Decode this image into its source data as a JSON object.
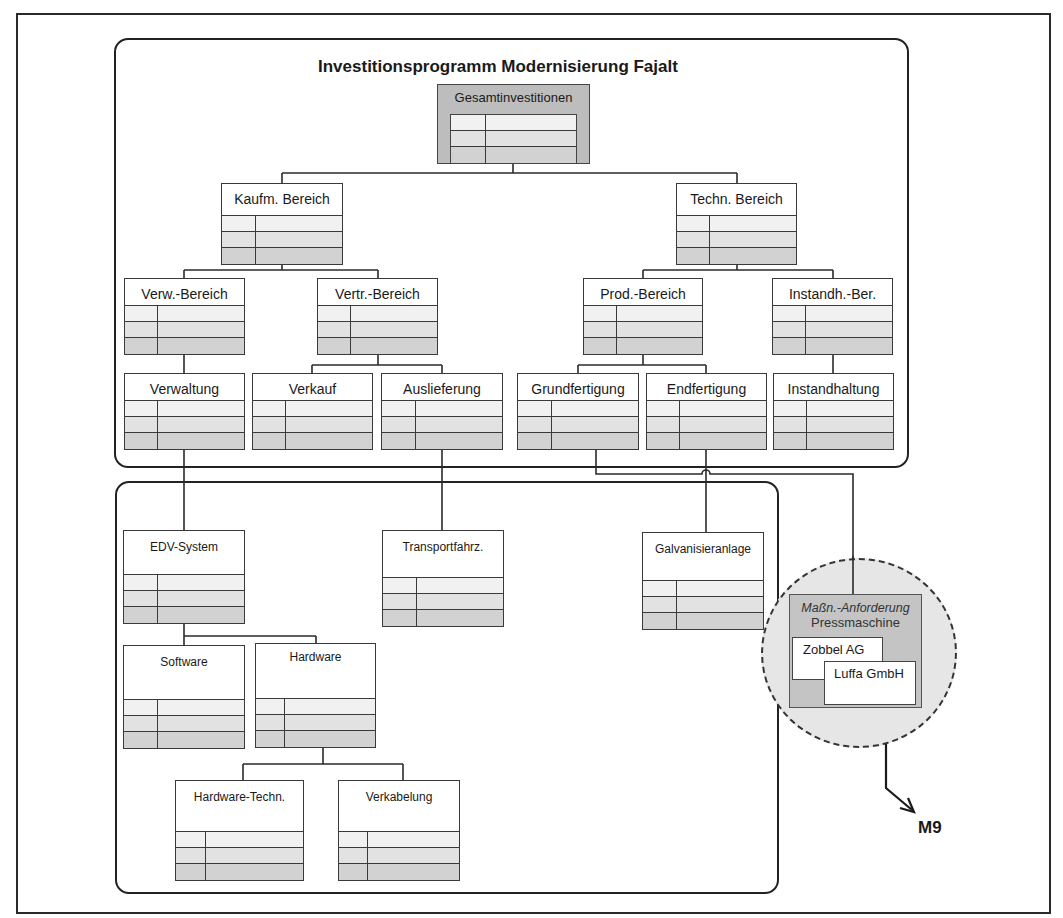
{
  "diagram": {
    "title": "Investitionsprogramm Modernisierung Fajalt",
    "root": {
      "label": "Gesamtinvestitionen"
    },
    "upper_nodes": {
      "kaufm": "Kaufm. Bereich",
      "techn": "Techn. Bereich",
      "verw_bereich": "Verw.-Bereich",
      "vertr_bereich": "Vertr.-Bereich",
      "prod_bereich": "Prod.-Bereich",
      "instandh_ber": "Instandh.-Ber.",
      "verwaltung": "Verwaltung",
      "verkauf": "Verkauf",
      "auslieferung": "Auslieferung",
      "grundfertigung": "Grundfertigung",
      "endfertigung": "Endfertigung",
      "instandhaltung": "Instandhaltung"
    },
    "lower_nodes": {
      "edv_system": "EDV-System",
      "transportfahrz": "Transportfahrz.",
      "galvanisieranlage": "Galvanisieranlage",
      "software": "Software",
      "hardware": "Hardware",
      "hardware_techn": "Hardware-Techn.",
      "verkabelung": "Verkabelung"
    },
    "measure_request": {
      "heading": "Maßn.-Anforderung",
      "subject": "Pressmaschine",
      "suppliers": [
        "Zobbel AG",
        "Luffa GmbH"
      ]
    },
    "reference_label": "M9"
  },
  "colors": {
    "line": "#2a2a2a",
    "root_fill": "#bdbdbd",
    "row_light": "#f1f1f1",
    "row_mid": "#e2e2e2",
    "row_dark": "#d2d2d2",
    "circle_fill": "#e6e6e6",
    "request_fill": "#c4c4c4"
  }
}
